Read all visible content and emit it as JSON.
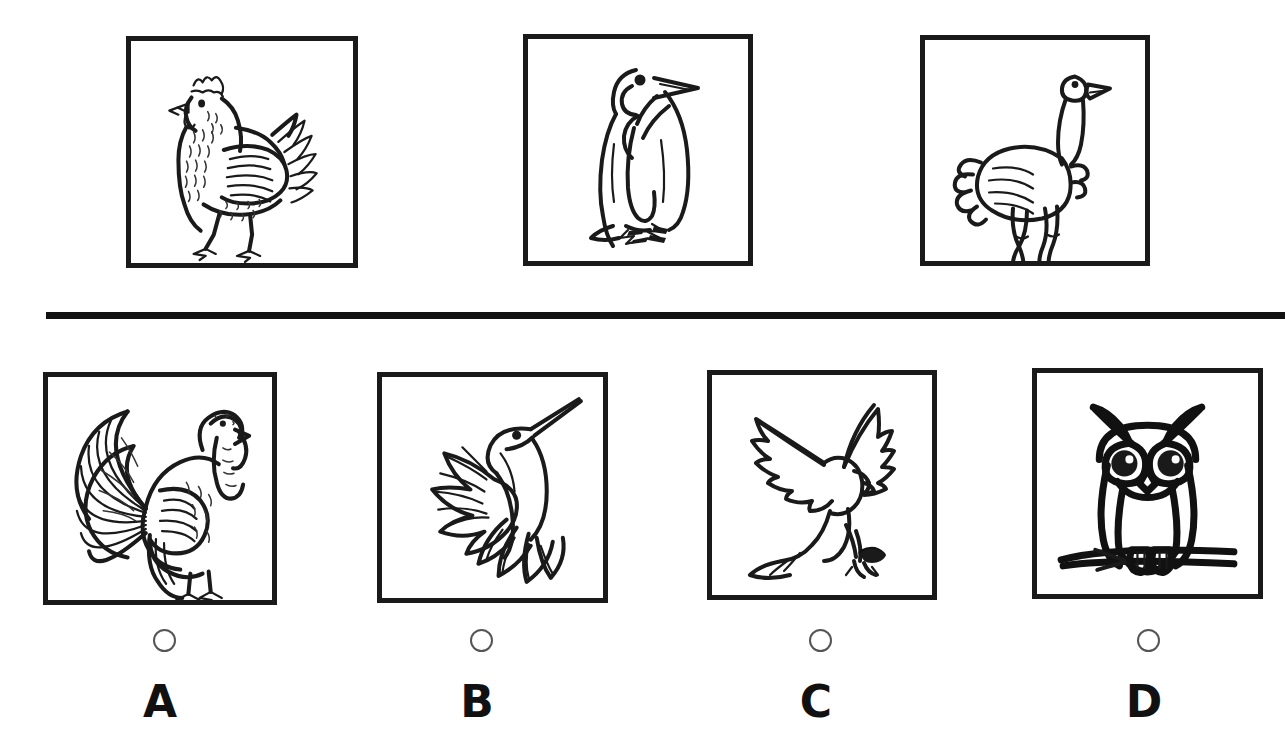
{
  "question": {
    "type": "multiple-choice-image",
    "layout": "two-rows-separated-by-rule",
    "prompt_row_label": "stimulus-birds",
    "answer_row_label": "answer-choices"
  },
  "divider": {
    "name": "horizontal-rule",
    "color": "#111111"
  },
  "stimulus": {
    "count": 3,
    "items": [
      {
        "id": "stimulus-1",
        "subject": "chicken",
        "alt": "Detailed engraved illustration of a hen standing in profile facing left",
        "icon": "chicken-illustration",
        "x": 126,
        "y": 36,
        "w": 232,
        "h": 232
      },
      {
        "id": "stimulus-2",
        "subject": "penguin",
        "alt": "Line drawing of a king penguin standing upright facing right",
        "icon": "penguin-illustration",
        "x": 523,
        "y": 34,
        "w": 230,
        "h": 232
      },
      {
        "id": "stimulus-3",
        "subject": "ostrich",
        "alt": "Line drawing of an ostrich standing with long neck raised facing right",
        "icon": "ostrich-illustration",
        "x": 920,
        "y": 35,
        "w": 230,
        "h": 231
      }
    ]
  },
  "choices": {
    "count": 4,
    "selected": null,
    "items": [
      {
        "letter": "A",
        "subject": "turkey",
        "alt": "Engraved illustration of a turkey with fanned tail feathers facing right",
        "icon": "turkey-illustration",
        "x": 43,
        "y": 372,
        "w": 234,
        "h": 233,
        "marker_x": 153,
        "marker_y": 629,
        "letter_x": 130,
        "letter_y": 680,
        "selected": false
      },
      {
        "letter": "B",
        "subject": "hummingbird",
        "alt": "Line drawing of a hummingbird hovering in flight with wings spread",
        "icon": "hummingbird-illustration",
        "x": 377,
        "y": 372,
        "w": 231,
        "h": 231,
        "marker_x": 470,
        "marker_y": 629,
        "letter_x": 447,
        "letter_y": 680,
        "selected": false
      },
      {
        "letter": "C",
        "subject": "eagle",
        "alt": "Line drawing of a bird of prey diving with wings raised and talons extended",
        "icon": "eagle-illustration",
        "x": 707,
        "y": 370,
        "w": 230,
        "h": 230,
        "marker_x": 809,
        "marker_y": 629,
        "letter_x": 786,
        "letter_y": 680,
        "selected": false
      },
      {
        "letter": "D",
        "subject": "owl",
        "alt": "Bold line drawing of an owl perched on a branch facing forward",
        "icon": "owl-illustration",
        "x": 1032,
        "y": 368,
        "w": 231,
        "h": 231,
        "marker_x": 1137,
        "marker_y": 629,
        "letter_x": 1114,
        "letter_y": 680,
        "selected": false
      }
    ]
  },
  "colors": {
    "ink": "#1a1a1a",
    "rule": "#111111",
    "marker_stroke": "#555555",
    "page_background": "#ffffff"
  }
}
